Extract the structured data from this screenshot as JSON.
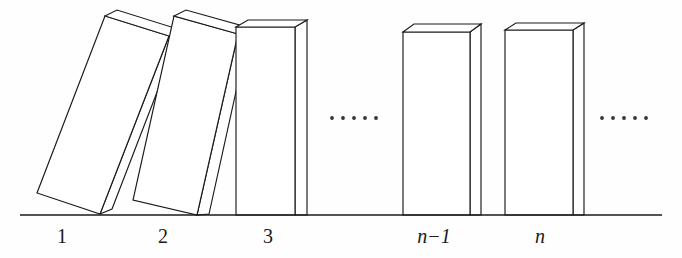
{
  "figure": {
    "background_color": "#fefefe",
    "stroke_color": "#1a1a1a",
    "fill_color": "#ffffff",
    "ground_line": {
      "name": "ground",
      "x1": 20,
      "y1": 215,
      "x2": 662,
      "y2": 215
    },
    "labels": [
      {
        "id": "label-1",
        "text": "1",
        "x": 62,
        "y": 243,
        "italic": false
      },
      {
        "id": "label-2",
        "text": "2",
        "x": 163,
        "y": 243,
        "italic": false
      },
      {
        "id": "label-3",
        "text": "3",
        "x": 268,
        "y": 243,
        "italic": false
      },
      {
        "id": "label-n-1",
        "text": "n−1",
        "x": 434,
        "y": 243,
        "italic": true
      },
      {
        "id": "label-n",
        "text": "n",
        "x": 540,
        "y": 243,
        "italic": true
      }
    ],
    "ellipses": [
      {
        "id": "ellipsis-left",
        "cy": 118,
        "dot_count": 5,
        "start_x": 332,
        "spacing": 11,
        "radius": 1.9
      },
      {
        "id": "ellipsis-right",
        "cy": 118,
        "dot_count": 5,
        "start_x": 602,
        "spacing": 11,
        "radius": 1.9
      }
    ],
    "dominoes": [
      {
        "id": "domino-1",
        "label": "1",
        "state": "tilted",
        "front": "105,16 169,36 100,214 37,193",
        "side": "105,16 117,10 181,30 169,36",
        "top": "105,16 117,10 181,30 169,36",
        "side_band": "169,36 181,30 112,209 100,214"
      },
      {
        "id": "domino-2",
        "label": "2",
        "state": "tilted",
        "front": "174,16 238,34 197,215 133,200",
        "side": "174,16 186,10 250,28 238,34",
        "top": "174,16 186,10 250,28 238,34",
        "side_band": "238,34 250,28 209,214 197,215"
      },
      {
        "id": "domino-3",
        "label": "3",
        "state": "upright",
        "front": "236,27 295,27 295,215 236,215",
        "side": "236,27 248,20 307,20 295,27",
        "top": "236,27 248,20 307,20 295,27",
        "side_band": "295,27 307,20 307,215 295,215"
      },
      {
        "id": "domino-n-1",
        "label": "n−1",
        "state": "upright",
        "front": "403,32 470,32 470,215 403,215",
        "side": "403,32 414,24 481,24 470,32",
        "top": "403,32 414,24 481,24 470,32",
        "side_band": "470,32 481,24 481,215 470,215"
      },
      {
        "id": "domino-n",
        "label": "n",
        "state": "upright",
        "front": "505,30 573,30 573,215 505,215",
        "side": "505,30 516,23 584,23 573,30",
        "top": "505,30 516,23 584,23 573,30",
        "side_band": "573,30 584,23 584,215 573,215"
      }
    ]
  }
}
